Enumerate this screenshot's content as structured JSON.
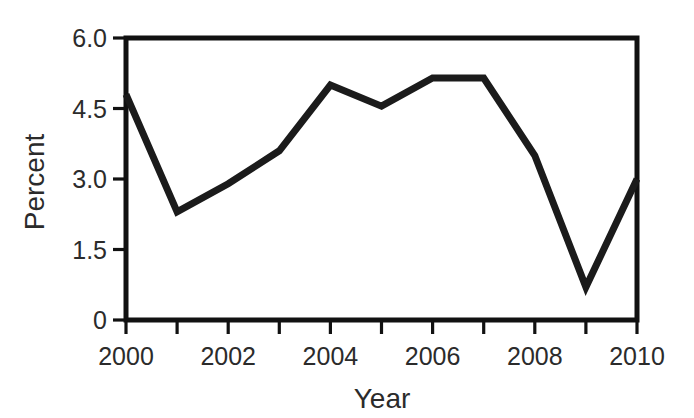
{
  "chart_data": {
    "type": "line",
    "title": "",
    "xlabel": "Year",
    "ylabel": "Percent",
    "x": [
      2000,
      2001,
      2002,
      2003,
      2004,
      2005,
      2006,
      2007,
      2008,
      2009,
      2010
    ],
    "values": [
      4.8,
      2.3,
      2.9,
      3.6,
      5.0,
      4.55,
      5.15,
      5.15,
      3.5,
      0.7,
      3.0
    ],
    "series": [
      {
        "name": "Percent",
        "values": [
          4.8,
          2.3,
          2.9,
          3.6,
          5.0,
          4.55,
          5.15,
          5.15,
          3.5,
          0.7,
          3.0
        ]
      }
    ],
    "xlim": [
      2000,
      2010
    ],
    "ylim": [
      0,
      6.0
    ],
    "grid": false,
    "legend": false,
    "y_ticks": [
      0,
      1.5,
      3.0,
      4.5,
      6.0
    ],
    "y_tick_labels": [
      "0",
      "1.5",
      "3.0",
      "4.5",
      "6.0"
    ],
    "x_ticks": [
      2000,
      2001,
      2002,
      2003,
      2004,
      2005,
      2006,
      2007,
      2008,
      2009,
      2010
    ],
    "x_tick_labels": [
      "2000",
      "",
      "2002",
      "",
      "2004",
      "",
      "2006",
      "",
      "2008",
      "",
      "2010"
    ],
    "x_labeled_ticks": [
      {
        "value": 2000,
        "label": "2000"
      },
      {
        "value": 2002,
        "label": "2002"
      },
      {
        "value": 2004,
        "label": "2004"
      },
      {
        "value": 2006,
        "label": "2006"
      },
      {
        "value": 2008,
        "label": "2008"
      },
      {
        "value": 2010,
        "label": "2010"
      }
    ],
    "line_color": "#1b1b1b",
    "axis_color": "#111111",
    "background_color": "#ffffff"
  }
}
